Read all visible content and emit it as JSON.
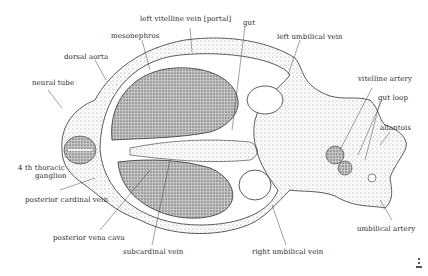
{
  "figure": {
    "labels": {
      "left_vitelline_vein": "left vitelline vein [portal]",
      "gut": "gut",
      "mesonephros": "mesonephros",
      "left_umbilical_vein": "left umbilical vein",
      "dorsal_aorta": "dorsal aorta",
      "neural_tube": "neural tube",
      "vitelline_artery": "vitelline artery",
      "gut_loop": "gut  loop",
      "allantois": "allantois",
      "thoracic_ganglion_1": "4 th thoracic",
      "thoracic_ganglion_2": "ganglion",
      "posterior_cardinal_vein": "posterior cardinal vein",
      "posterior_vena_cava": "posterior vena cava",
      "subcardinal_vein": "subcardinal vein",
      "right_umbilical_vein": "right umbilical vein",
      "umbilical_artery": "umbilical artery"
    },
    "colors": {
      "ink": "#2a2a2a",
      "stipple": "#555555",
      "background": "#ffffff"
    }
  }
}
